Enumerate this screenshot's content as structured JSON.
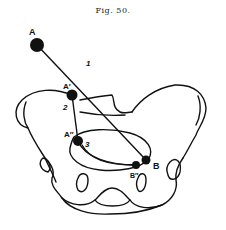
{
  "figure": {
    "title": "Fig. 50."
  },
  "points": [
    {
      "id": "A",
      "label": "A",
      "x": 37,
      "y": 45
    },
    {
      "id": "A1",
      "label": "A′",
      "x": 72,
      "y": 95
    },
    {
      "id": "A2",
      "label": "A″",
      "x": 78,
      "y": 141
    },
    {
      "id": "B",
      "label": "B",
      "x": 146,
      "y": 160
    },
    {
      "id": "B2",
      "label": "B″",
      "x": 136,
      "y": 165
    }
  ],
  "segment_labels": [
    {
      "label": "1",
      "x": 86,
      "y": 63
    },
    {
      "label": "2",
      "x": 67,
      "y": 108
    },
    {
      "label": "3",
      "x": 87,
      "y": 144
    }
  ],
  "colors": {
    "ink": "#111111",
    "background": "#ffffff"
  }
}
